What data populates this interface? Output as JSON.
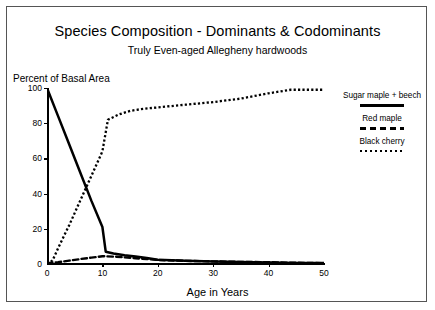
{
  "chart_data": {
    "type": "line",
    "title": "Species Composition - Dominants & Codominants",
    "subtitle": "Truly Even-aged Allegheny hardwoods",
    "xlabel": "Age in Years",
    "ylabel": "Percent of Basal Area",
    "xlim": [
      0,
      50
    ],
    "ylim": [
      0,
      100
    ],
    "xticks": [
      "0",
      "10",
      "20",
      "30",
      "40",
      "50"
    ],
    "yticks": [
      "0",
      "20",
      "40",
      "60",
      "80",
      "100"
    ],
    "grid": false,
    "legend_position": "right",
    "series": [
      {
        "name": "Sugar maple + beech",
        "style": "solid",
        "color": "#000000",
        "x": [
          0,
          2,
          4,
          6,
          8,
          10,
          10.6,
          12,
          14,
          16,
          18,
          20,
          25,
          30,
          35,
          40,
          45,
          50
        ],
        "values": [
          100,
          84,
          68,
          52,
          36,
          21,
          7,
          6,
          5,
          4.2,
          3.4,
          2.4,
          1.8,
          1.4,
          1.1,
          0.8,
          0.6,
          0.5
        ]
      },
      {
        "name": "Red maple",
        "style": "dashed",
        "color": "#000000",
        "x": [
          0,
          2,
          4,
          6,
          8,
          10,
          12,
          14,
          16,
          18,
          20,
          25,
          30,
          35,
          40,
          45,
          50
        ],
        "values": [
          0.4,
          1.0,
          1.9,
          2.8,
          3.6,
          4.4,
          4.2,
          3.8,
          3.3,
          2.8,
          2.3,
          1.8,
          1.5,
          1.2,
          1.0,
          0.7,
          0.5
        ]
      },
      {
        "name": "Black cherry",
        "style": "dotted",
        "color": "#000000",
        "x": [
          0,
          1,
          2,
          4,
          6,
          8,
          10,
          11,
          13,
          15,
          17,
          20,
          25,
          30,
          35,
          40,
          44,
          50
        ],
        "values": [
          0,
          2,
          9,
          22,
          36,
          50,
          64,
          82,
          85,
          87,
          88,
          89,
          90.5,
          92,
          94,
          97,
          99,
          99
        ]
      }
    ]
  },
  "axes": {
    "y_ticks": [
      {
        "label": "100",
        "value": 100
      },
      {
        "label": "80",
        "value": 80
      },
      {
        "label": "60",
        "value": 60
      },
      {
        "label": "40",
        "value": 40
      },
      {
        "label": "20",
        "value": 20
      },
      {
        "label": "0",
        "value": 0
      }
    ],
    "x_ticks": [
      {
        "label": "0",
        "value": 0
      },
      {
        "label": "10",
        "value": 10
      },
      {
        "label": "20",
        "value": 20
      },
      {
        "label": "30",
        "value": 30
      },
      {
        "label": "40",
        "value": 40
      },
      {
        "label": "50",
        "value": 50
      }
    ]
  },
  "legend": {
    "entries": [
      {
        "label": "Sugar maple + beech",
        "style": "solid"
      },
      {
        "label": "Red maple",
        "style": "dashed"
      },
      {
        "label": "Black cherry",
        "style": "dotted"
      }
    ]
  }
}
